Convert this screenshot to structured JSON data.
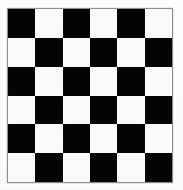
{
  "image": {
    "title": "Checkerboard pattern",
    "width": 183,
    "height": 190,
    "background_color": "#ffffff"
  },
  "board": {
    "name": "checkerboard",
    "rows": 6,
    "columns": 6,
    "dark_color": "#040404",
    "light_color": "#fbfbfb",
    "border_color": "#8e8e8e",
    "border_width": 1,
    "top_left_square": "dark",
    "left": 7,
    "top": 8,
    "width": 166,
    "height": 175,
    "cells": [
      [
        "dark",
        "light",
        "dark",
        "light",
        "dark",
        "light"
      ],
      [
        "light",
        "dark",
        "light",
        "dark",
        "light",
        "dark"
      ],
      [
        "dark",
        "light",
        "dark",
        "light",
        "dark",
        "light"
      ],
      [
        "light",
        "dark",
        "light",
        "dark",
        "light",
        "dark"
      ],
      [
        "dark",
        "light",
        "dark",
        "light",
        "dark",
        "light"
      ],
      [
        "light",
        "dark",
        "light",
        "dark",
        "light",
        "dark"
      ]
    ]
  }
}
